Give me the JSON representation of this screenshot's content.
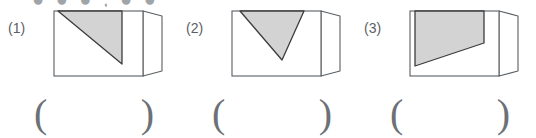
{
  "page": {
    "background_color": "#ffffff",
    "top_cutoff_text": "● ● ● , ● ●"
  },
  "style": {
    "shape_fill": "#d3d3d3",
    "shape_stroke": "#3c3c3c",
    "box_stroke": "#5a5f63",
    "text_color": "#5b6064",
    "paren_color": "#6c7175"
  },
  "exercises": [
    {
      "number": "(1)",
      "figure_name": "folded-card-with-shaded-triangle-1",
      "description": "Rectangular card with a right-angle flap on the right; shaded right triangle occupying the upper-left portion with hypotenuse falling from top-left to mid-right.",
      "shape": {
        "type": "triangle",
        "points": "18,3 82,3 82,56"
      },
      "answer": {
        "open": "(",
        "close": ")",
        "value": ""
      }
    },
    {
      "number": "(2)",
      "figure_name": "folded-card-with-shaded-triangle-2",
      "description": "Rectangular card with a right-angle flap on the right; shaded triangle with a flat top edge and apex pointing down-left of center.",
      "shape": {
        "type": "triangle",
        "points": "22,3 86,3 64,52"
      },
      "answer": {
        "open": "(",
        "close": ")",
        "value": ""
      }
    },
    {
      "number": "(3)",
      "figure_name": "folded-card-with-shaded-quadrilateral-3",
      "description": "Rectangular card with a right-angle flap on the right; shaded quadrilateral (trapezoid) with flat top edge, tapering downward to the left.",
      "shape": {
        "type": "quadrilateral",
        "points": "19,3 88,3 88,35 19,58"
      },
      "answer": {
        "open": "(",
        "close": ")",
        "value": ""
      }
    }
  ]
}
